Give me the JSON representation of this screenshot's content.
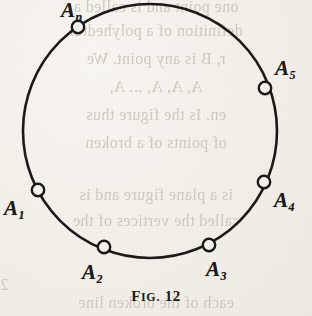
{
  "figure": {
    "caption_prefix": "F",
    "caption_smallcaps": "IG.",
    "caption_number": "12",
    "caption_full": "Fig. 12",
    "shape": "circle",
    "ink_color": "#1c1a17",
    "paper_color": "#f3f1ec",
    "bleed_color": "#b9b1a2",
    "circle": {
      "center_x": 150,
      "center_y": 131,
      "radius": 127,
      "stroke_width": 2.6
    },
    "points": [
      {
        "id": "A1",
        "letter": "A",
        "subscript": "1",
        "marker_x": 38,
        "marker_y": 190,
        "label_x": 4,
        "label_y": 198
      },
      {
        "id": "A2",
        "letter": "A",
        "subscript": "2",
        "marker_x": 104,
        "marker_y": 247,
        "label_x": 82,
        "label_y": 262
      },
      {
        "id": "A3",
        "letter": "A",
        "subscript": "3",
        "marker_x": 209,
        "marker_y": 245,
        "label_x": 206,
        "label_y": 259
      },
      {
        "id": "A4",
        "letter": "A",
        "subscript": "4",
        "marker_x": 264,
        "marker_y": 182,
        "label_x": 274,
        "label_y": 190
      },
      {
        "id": "A5",
        "letter": "A",
        "subscript": "5",
        "marker_x": 265,
        "marker_y": 88,
        "label_x": 275,
        "label_y": 58
      },
      {
        "id": "An",
        "letter": "A",
        "subscript": "n",
        "marker_x": 78,
        "marker_y": 27,
        "label_x": 61,
        "label_y": 0
      }
    ],
    "marker": {
      "radius": 6.2,
      "stroke_width": 2.4,
      "fill": "#f3f1ec"
    }
  },
  "bleedthrough_lines": [
    {
      "text": "one point and is called a",
      "top": -2
    },
    {
      "text": "definition of a polyhedral",
      "top": 22
    },
    {
      "text": "r, B is any point. We",
      "top": 50
    },
    {
      "text": "A, A, A, ... A,",
      "top": 78
    },
    {
      "text": "en. Is the figure thus",
      "top": 106
    },
    {
      "text": "of points of a broken",
      "top": 134
    },
    {
      "text": "is a plane figure and is",
      "top": 186
    },
    {
      "text": "called the vertices of the",
      "top": 212
    },
    {
      "text": "2",
      "top": 276
    },
    {
      "text": "each of the broken line",
      "top": 294
    }
  ]
}
